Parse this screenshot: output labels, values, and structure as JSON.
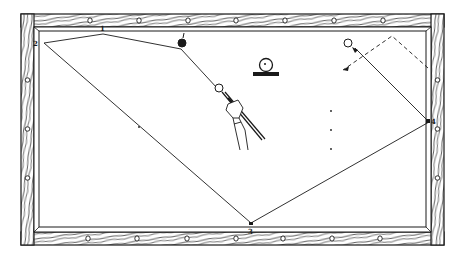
{
  "diagram": {
    "colors": {
      "ink": "#1a1a1a",
      "paper": "#ffffff",
      "rail_wood": "#ffffff"
    },
    "table": {
      "outer": {
        "x": 21,
        "y": 14,
        "w": 423,
        "h": 231
      },
      "cushion": {
        "x": 37,
        "y": 29,
        "w": 392,
        "h": 202
      },
      "bed": {
        "x": 41,
        "y": 33,
        "w": 384,
        "h": 194
      },
      "diamonds_top_x": [
        90,
        139,
        188,
        236,
        285,
        334,
        383
      ],
      "diamonds_bottom_x": [
        88,
        137,
        187,
        236,
        283,
        332,
        380
      ],
      "diamonds_left_y": [
        80,
        129,
        178
      ],
      "diamonds_right_y": [
        80,
        129,
        178
      ]
    },
    "cushion_labels": [
      {
        "id": "1",
        "text": "1",
        "x": 100,
        "y": 25
      },
      {
        "id": "2",
        "text": "2",
        "x": 33,
        "y": 40
      },
      {
        "id": "3",
        "text": "3",
        "x": 248,
        "y": 228
      },
      {
        "id": "4",
        "text": "4",
        "x": 431,
        "y": 118
      }
    ],
    "shot_path": {
      "points": [
        [
          217,
          88
        ],
        [
          181,
          49
        ],
        [
          103,
          34
        ],
        [
          44,
          43
        ],
        [
          251,
          223
        ],
        [
          429,
          122
        ],
        [
          355,
          48
        ]
      ],
      "style": "solid"
    },
    "dashed_path": {
      "points": [
        [
          428,
          68
        ],
        [
          392,
          36
        ],
        [
          343,
          70
        ]
      ],
      "style": "dashed"
    },
    "balls": [
      {
        "name": "cue-ball",
        "x": 219,
        "y": 88,
        "r": 4,
        "fill": "#ffffff"
      },
      {
        "name": "object-ball-black",
        "x": 182,
        "y": 43,
        "r": 4,
        "fill": "#1a1a1a"
      },
      {
        "name": "target-ball",
        "x": 348,
        "y": 43,
        "r": 4,
        "fill": "#ffffff"
      }
    ],
    "ball_on_stand_icon": {
      "x": 266,
      "y": 66
    },
    "spots": [
      [
        331,
        111
      ],
      [
        331,
        130
      ],
      [
        331,
        149
      ],
      [
        139,
        127
      ]
    ],
    "hand_with_cue": {
      "x": 222,
      "y": 92
    }
  }
}
